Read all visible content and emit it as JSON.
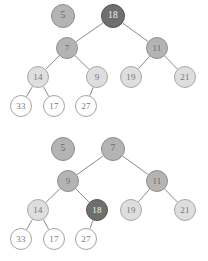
{
  "figure": {
    "width": 208,
    "height": 261,
    "background": "#ffffff",
    "palette": {
      "dark": "#6f6f6f",
      "medium": "#b4b4b4",
      "light": "#dedede",
      "white": "#ffffff",
      "edge": "#8a8a8a",
      "border": "#9a9a9a",
      "label_dark_on_light": "#6a6a6a",
      "label_light_on_dark": "#f0f0f0"
    }
  },
  "diagrams": [
    {
      "id": "tree-top",
      "name": "before-swap",
      "nodes": [
        {
          "id": "t5",
          "label": "5",
          "cx": 63,
          "cy": 16,
          "r": 12,
          "shade": "medium",
          "detached": true
        },
        {
          "id": "t18",
          "label": "18",
          "cx": 113,
          "cy": 16,
          "r": 12,
          "shade": "dark",
          "detached": false
        },
        {
          "id": "t7",
          "label": "7",
          "cx": 67,
          "cy": 48,
          "r": 11,
          "shade": "medium",
          "detached": false
        },
        {
          "id": "t11",
          "label": "11",
          "cx": 157,
          "cy": 48,
          "r": 11,
          "shade": "medium",
          "detached": false
        },
        {
          "id": "t14",
          "label": "14",
          "cx": 38,
          "cy": 77,
          "r": 11,
          "shade": "light",
          "detached": false
        },
        {
          "id": "t9",
          "label": "9",
          "cx": 97,
          "cy": 77,
          "r": 11,
          "shade": "light",
          "detached": false
        },
        {
          "id": "t19",
          "label": "19",
          "cx": 131,
          "cy": 77,
          "r": 11,
          "shade": "light",
          "detached": false
        },
        {
          "id": "t21",
          "label": "21",
          "cx": 185,
          "cy": 77,
          "r": 11,
          "shade": "light",
          "detached": false
        },
        {
          "id": "t33",
          "label": "33",
          "cx": 21,
          "cy": 106,
          "r": 11,
          "shade": "white",
          "detached": false
        },
        {
          "id": "t17",
          "label": "17",
          "cx": 54,
          "cy": 106,
          "r": 11,
          "shade": "white",
          "detached": false
        },
        {
          "id": "t27",
          "label": "27",
          "cx": 86,
          "cy": 106,
          "r": 11,
          "shade": "white",
          "detached": false
        }
      ],
      "edges": [
        {
          "from": "t18",
          "to": "t7"
        },
        {
          "from": "t18",
          "to": "t11"
        },
        {
          "from": "t7",
          "to": "t14"
        },
        {
          "from": "t7",
          "to": "t9"
        },
        {
          "from": "t11",
          "to": "t19"
        },
        {
          "from": "t11",
          "to": "t21"
        },
        {
          "from": "t14",
          "to": "t33"
        },
        {
          "from": "t14",
          "to": "t17"
        },
        {
          "from": "t9",
          "to": "t27"
        }
      ]
    },
    {
      "id": "tree-bottom",
      "name": "after-swap",
      "nodes": [
        {
          "id": "b5",
          "label": "5",
          "cx": 63,
          "cy": 18,
          "r": 12,
          "shade": "medium",
          "detached": true
        },
        {
          "id": "b7",
          "label": "7",
          "cx": 113,
          "cy": 18,
          "r": 12,
          "shade": "medium",
          "detached": false
        },
        {
          "id": "b9",
          "label": "9",
          "cx": 68,
          "cy": 50,
          "r": 11,
          "shade": "medium",
          "detached": false
        },
        {
          "id": "b11",
          "label": "11",
          "cx": 157,
          "cy": 50,
          "r": 11,
          "shade": "medium",
          "detached": false
        },
        {
          "id": "b14",
          "label": "14",
          "cx": 38,
          "cy": 79,
          "r": 11,
          "shade": "light",
          "detached": false
        },
        {
          "id": "b18",
          "label": "18",
          "cx": 97,
          "cy": 79,
          "r": 11,
          "shade": "dark",
          "detached": false
        },
        {
          "id": "b19",
          "label": "19",
          "cx": 131,
          "cy": 79,
          "r": 11,
          "shade": "light",
          "detached": false
        },
        {
          "id": "b21",
          "label": "21",
          "cx": 185,
          "cy": 79,
          "r": 11,
          "shade": "light",
          "detached": false
        },
        {
          "id": "b33",
          "label": "33",
          "cx": 21,
          "cy": 108,
          "r": 11,
          "shade": "white",
          "detached": false
        },
        {
          "id": "b17",
          "label": "17",
          "cx": 54,
          "cy": 108,
          "r": 11,
          "shade": "white",
          "detached": false
        },
        {
          "id": "b27",
          "label": "27",
          "cx": 86,
          "cy": 108,
          "r": 11,
          "shade": "white",
          "detached": false
        }
      ],
      "edges": [
        {
          "from": "b7",
          "to": "b9"
        },
        {
          "from": "b7",
          "to": "b11"
        },
        {
          "from": "b9",
          "to": "b14"
        },
        {
          "from": "b9",
          "to": "b18"
        },
        {
          "from": "b11",
          "to": "b19"
        },
        {
          "from": "b11",
          "to": "b21"
        },
        {
          "from": "b14",
          "to": "b33"
        },
        {
          "from": "b14",
          "to": "b17"
        },
        {
          "from": "b18",
          "to": "b27"
        }
      ]
    }
  ]
}
